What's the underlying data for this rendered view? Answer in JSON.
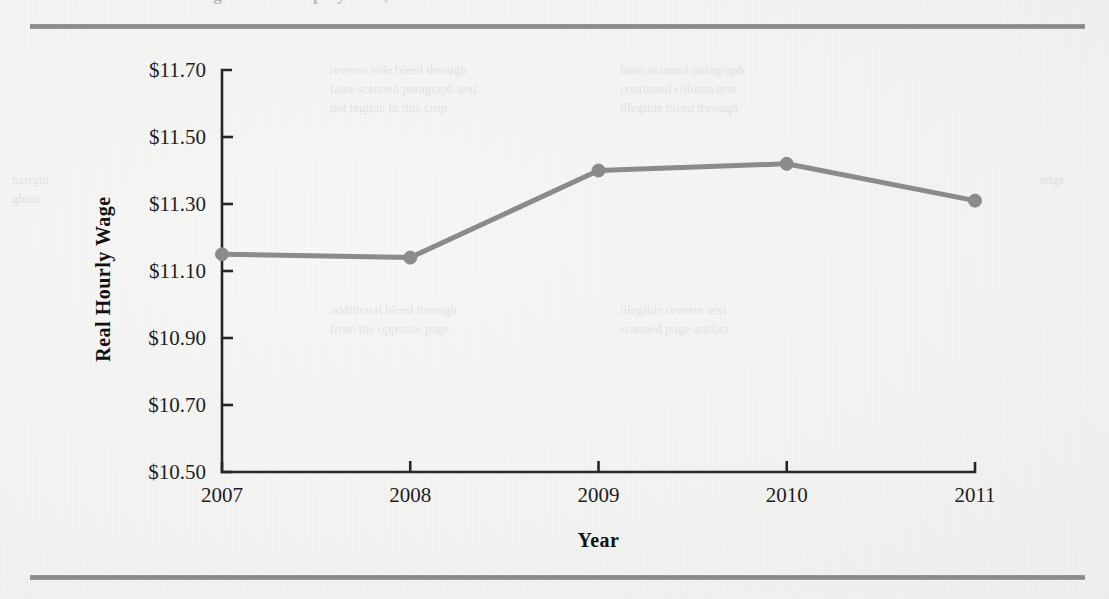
{
  "page": {
    "background_color": "#f3f3f2",
    "rule_color": "#8a8a8a",
    "top_cropped_heading": "Minimum Wage and Unemployment, 2007-2011"
  },
  "ghost_text": {
    "block_a": "reverse side bleed through\nfaint scanned paragraph text\nnot legible in this crop",
    "block_b": "faint scanned paragraph\ncontinued column text\nillegible bleed through",
    "block_c": "additional bleed through\nfrom the opposite page",
    "block_d": "illegible reverse text\nscanned page artifact",
    "block_e": "margin\nghost",
    "block_f": "edge"
  },
  "chart_data": {
    "type": "line",
    "title": "",
    "xlabel": "Year",
    "ylabel": "Real Hourly Wage",
    "categories": [
      "2007",
      "2008",
      "2009",
      "2010",
      "2011"
    ],
    "x": [
      2007,
      2008,
      2009,
      2010,
      2011
    ],
    "values": [
      11.15,
      11.14,
      11.4,
      11.42,
      11.31
    ],
    "series": [
      {
        "name": "Real Hourly Wage",
        "values": [
          11.15,
          11.14,
          11.4,
          11.42,
          11.31
        ]
      }
    ],
    "ylim": [
      10.5,
      11.7
    ],
    "ytick_values": [
      11.7,
      11.5,
      11.3,
      11.1,
      10.9,
      10.7,
      10.5
    ],
    "ytick_labels": [
      "$11.70",
      "$11.50",
      "$11.30",
      "$11.10",
      "$10.90",
      "$10.70",
      "$10.50"
    ],
    "xtick_labels": [
      "2007",
      "2008",
      "2009",
      "2010",
      "2011"
    ],
    "grid": false,
    "legend": "none",
    "line_color": "#8b8b8b",
    "marker": "circle",
    "marker_color": "#8b8b8b",
    "axis_color": "#262626"
  }
}
